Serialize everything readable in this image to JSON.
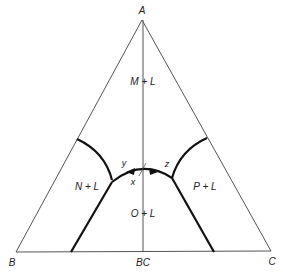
{
  "diagram": {
    "type": "ternary-phase-diagram",
    "vertices": {
      "top": "A",
      "bottom_left": "B",
      "bottom_right": "C",
      "base_midpoint": "BC"
    },
    "fields": {
      "top": "M + L",
      "left": "N + L",
      "right": "P + L",
      "bottom": "O + L"
    },
    "points": {
      "left_arrow": "y",
      "right_arrow": "z",
      "center": "x"
    },
    "colors": {
      "thin_line": "#555555",
      "thick_line": "#111111",
      "text": "#222222"
    }
  }
}
